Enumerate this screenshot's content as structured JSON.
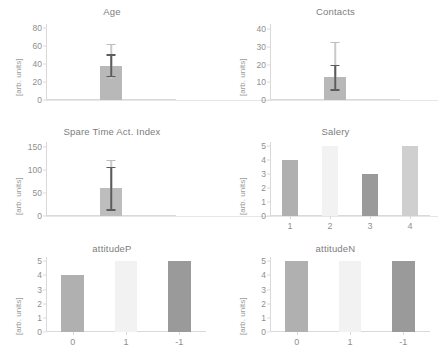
{
  "figure": {
    "ylabel_text": "[arb. units]",
    "panel_count": 6
  },
  "chart_data": [
    {
      "type": "bar",
      "title": "Age",
      "xlabel": "",
      "ylabel": "[arb. units]",
      "ylim": [
        0,
        85
      ],
      "yticks": [
        0,
        20,
        40,
        60,
        80
      ],
      "categories": [
        ""
      ],
      "values": [
        38
      ],
      "errors_low": [
        27
      ],
      "errors_high": [
        51
      ],
      "whisker_low": [
        23
      ],
      "whisker_high": [
        63
      ],
      "bar_colors": [
        "#b8b8b8"
      ],
      "grid": false,
      "legend": "none"
    },
    {
      "type": "bar",
      "title": "Contacts",
      "xlabel": "",
      "ylabel": "[arb. units]",
      "ylim": [
        0,
        43
      ],
      "yticks": [
        0,
        10,
        20,
        30,
        40
      ],
      "categories": [
        ""
      ],
      "values": [
        13
      ],
      "errors_low": [
        6
      ],
      "errors_high": [
        20
      ],
      "whisker_low": [
        5
      ],
      "whisker_high": [
        33
      ],
      "bar_colors": [
        "#b8b8b8"
      ],
      "grid": false,
      "legend": "none"
    },
    {
      "type": "bar",
      "title": "Spare Time Act. Index",
      "xlabel": "",
      "ylabel": "[arb. units]",
      "ylim": [
        0,
        160
      ],
      "yticks": [
        0,
        50,
        100,
        150
      ],
      "categories": [
        ""
      ],
      "values": [
        60
      ],
      "errors_low": [
        15
      ],
      "errors_high": [
        107
      ],
      "whisker_low": [
        12
      ],
      "whisker_high": [
        122
      ],
      "bar_colors": [
        "#bdbdbd"
      ],
      "grid": false,
      "legend": "none"
    },
    {
      "type": "bar",
      "title": "Salery",
      "xlabel": "",
      "ylabel": "[arb. units]",
      "ylim": [
        0,
        5.3
      ],
      "yticks": [
        0,
        1,
        2,
        3,
        4,
        5
      ],
      "categories": [
        "1",
        "2",
        "3",
        "4"
      ],
      "values": [
        4,
        5,
        3,
        5
      ],
      "bar_colors": [
        "#b0b0b0",
        "#f2f2f2",
        "#9a9a9a",
        "#cfcfcf"
      ],
      "grid": false,
      "legend": "none"
    },
    {
      "type": "bar",
      "title": "attitudeP",
      "xlabel": "",
      "ylabel": "[arb. units]",
      "ylim": [
        0,
        5.3
      ],
      "yticks": [
        0,
        1,
        2,
        3,
        4,
        5
      ],
      "categories": [
        "0",
        "1",
        "-1"
      ],
      "values": [
        4,
        5,
        5
      ],
      "bar_colors": [
        "#b0b0b0",
        "#f2f2f2",
        "#9a9a9a"
      ],
      "grid": false,
      "legend": "none"
    },
    {
      "type": "bar",
      "title": "attitudeN",
      "xlabel": "",
      "ylabel": "[arb. units]",
      "ylim": [
        0,
        5.3
      ],
      "yticks": [
        0,
        1,
        2,
        3,
        4,
        5
      ],
      "categories": [
        "0",
        "1",
        "-1"
      ],
      "values": [
        5,
        5,
        5
      ],
      "bar_colors": [
        "#b0b0b0",
        "#f2f2f2",
        "#9a9a9a"
      ],
      "grid": false,
      "legend": "none"
    }
  ]
}
